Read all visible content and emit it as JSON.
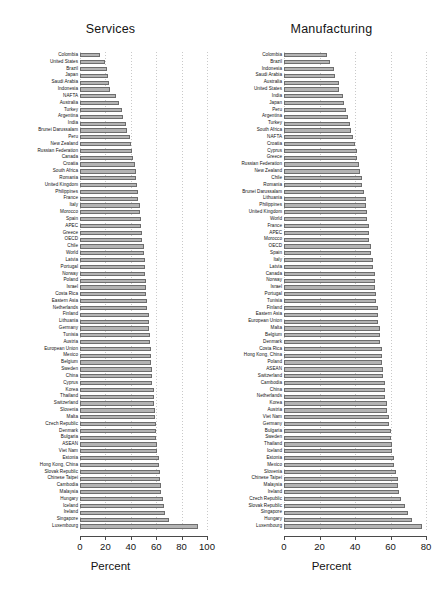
{
  "figure": {
    "width": 442,
    "height": 614,
    "background": "#ffffff",
    "bar_fill": "#b4b4b4",
    "bar_stroke": "#6e6e6e",
    "grid_color": "#c9c9c9"
  },
  "chart_data": [
    {
      "type": "bar",
      "orientation": "horizontal",
      "title": "Services",
      "xlabel": "Percent",
      "ylabel": "",
      "xlim": [
        0,
        100
      ],
      "xticks": [
        0,
        20,
        40,
        60,
        80,
        100
      ],
      "grid": true,
      "legend": "none",
      "categories": [
        "Colombia",
        "United States",
        "Brazil",
        "Japan",
        "Saudi Arabia",
        "Indonesia",
        "NAFTA",
        "Australia",
        "Turkey",
        "Argentina",
        "India",
        "Brunei Darussalam",
        "Peru",
        "New Zealand",
        "Russian Federation",
        "Canada",
        "Croatia",
        "South Africa",
        "Romania",
        "United Kingdom",
        "Philippines",
        "France",
        "Italy",
        "Morocco",
        "Spain",
        "APEC",
        "Greece",
        "OECD",
        "Chile",
        "World",
        "Latvia",
        "Portugal",
        "Norway",
        "Poland",
        "Israel",
        "Costa Rica",
        "Eastern Asia",
        "Netherlands",
        "Finland",
        "Lithuania",
        "Germany",
        "Tunisia",
        "Austria",
        "European Union",
        "Mexico",
        "Belgium",
        "Sweden",
        "China",
        "Cyprus",
        "Korea",
        "Thailand",
        "Switzerland",
        "Slovenia",
        "Malta",
        "Czech Republic",
        "Denmark",
        "Bulgaria",
        "ASEAN",
        "Viet Nam",
        "Estonia",
        "Hong Kong, China",
        "Slovak Republic",
        "Chinese Taipei",
        "Cambodia",
        "Malaysia",
        "Hungary",
        "Iceland",
        "Ireland",
        "Singapore",
        "Luxembourg"
      ],
      "values": [
        16,
        20,
        21,
        22,
        23,
        24,
        28,
        31,
        33,
        34,
        36,
        37,
        39,
        40,
        41,
        42,
        43,
        44,
        44,
        45,
        46,
        46,
        47,
        47,
        48,
        48,
        49,
        49,
        50,
        50,
        51,
        51,
        51,
        52,
        52,
        52,
        53,
        53,
        54,
        54,
        54,
        55,
        55,
        56,
        56,
        56,
        57,
        57,
        57,
        58,
        58,
        58,
        59,
        59,
        60,
        60,
        60,
        61,
        61,
        62,
        62,
        63,
        63,
        64,
        64,
        65,
        66,
        67,
        70,
        93
      ]
    },
    {
      "type": "bar",
      "orientation": "horizontal",
      "title": "Manufacturing",
      "xlabel": "Percent",
      "ylabel": "",
      "xlim": [
        0,
        80
      ],
      "xticks": [
        0,
        20,
        40,
        60,
        80
      ],
      "grid": true,
      "legend": "none",
      "categories": [
        "Colombia",
        "Brazil",
        "Indonesia",
        "Saudi Arabia",
        "Australia",
        "United States",
        "India",
        "Japan",
        "Peru",
        "Argentina",
        "Turkey",
        "South Africa",
        "NAFTA",
        "Croatia",
        "Cyprus",
        "Greece",
        "Russian Federation",
        "New Zealand",
        "Chile",
        "Romania",
        "Brunei Darussalam",
        "Lithuania",
        "Philippines",
        "United Kingdom",
        "World",
        "France",
        "APEC",
        "Morocco",
        "OECD",
        "Spain",
        "Italy",
        "Latvia",
        "Canada",
        "Norway",
        "Israel",
        "Portugal",
        "Tunisia",
        "Finland",
        "Eastern Asia",
        "European Union",
        "Malta",
        "Belgium",
        "Denmark",
        "Costa Rica",
        "Hong Kong, China",
        "Poland",
        "ASEAN",
        "Switzerland",
        "Cambodia",
        "China",
        "Netherlands",
        "Korea",
        "Austria",
        "Viet Nam",
        "Germany",
        "Bulgaria",
        "Sweden",
        "Thailand",
        "Iceland",
        "Estonia",
        "Mexico",
        "Slovenia",
        "Chinese Taipei",
        "Malaysia",
        "Ireland",
        "Czech Republic",
        "Slovak Republic",
        "Singapore",
        "Hungary",
        "Luxembourg"
      ],
      "values": [
        24,
        26,
        28,
        29,
        31,
        31,
        33,
        34,
        35,
        36,
        37,
        38,
        39,
        40,
        41,
        41,
        42,
        43,
        44,
        44,
        45,
        46,
        46,
        47,
        47,
        48,
        48,
        48,
        49,
        49,
        50,
        50,
        51,
        51,
        51,
        52,
        52,
        53,
        53,
        53,
        54,
        54,
        54,
        55,
        55,
        55,
        56,
        56,
        57,
        57,
        57,
        58,
        58,
        59,
        59,
        60,
        60,
        61,
        61,
        62,
        62,
        63,
        64,
        64,
        65,
        66,
        68,
        70,
        72,
        78
      ]
    }
  ]
}
